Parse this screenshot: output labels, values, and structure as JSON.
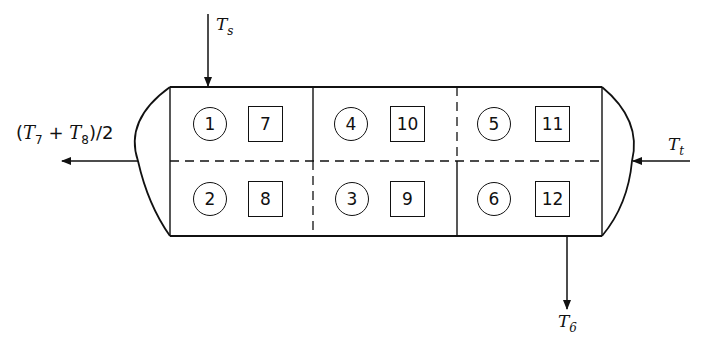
{
  "diagram": {
    "inputs": {
      "top": {
        "symbol": "T",
        "subscript": "s"
      },
      "right": {
        "symbol": "T",
        "subscript": "t"
      }
    },
    "outputs": {
      "left": {
        "prefix": "(",
        "sym1": "T",
        "sub1": "7",
        "plus": " + ",
        "sym2": "T",
        "sub2": "8",
        "suffix": ")/2"
      },
      "bottom": {
        "symbol": "T",
        "subscript": "6"
      }
    },
    "cells": [
      {
        "circle": "1",
        "square": "7"
      },
      {
        "circle": "4",
        "square": "10"
      },
      {
        "circle": "5",
        "square": "11"
      },
      {
        "circle": "2",
        "square": "8"
      },
      {
        "circle": "3",
        "square": "9"
      },
      {
        "circle": "6",
        "square": "12"
      }
    ]
  }
}
